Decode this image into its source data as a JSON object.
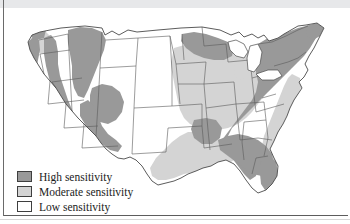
{
  "figure": {
    "type": "choropleth-map",
    "region": "United States",
    "variable": "sensitivity"
  },
  "colors": {
    "high": "#999999",
    "moderate": "#d4d4d4",
    "low": "#ffffff",
    "outline": "#5a5a5a",
    "border_dark": "#3f3f3f",
    "page_band": "#e7e8ea",
    "text": "#1c1c1c"
  },
  "legend": {
    "items": [
      {
        "label": "High sensitivity",
        "swatch": "#999999",
        "key": "high"
      },
      {
        "label": "Moderate sensitivity",
        "swatch": "#d4d4d4",
        "key": "moderate"
      },
      {
        "label": "Low sensitivity",
        "swatch": "#ffffff",
        "key": "low"
      }
    ]
  },
  "map_data": {
    "classification": [
      "High sensitivity",
      "Moderate sensitivity",
      "Low sensitivity"
    ],
    "regions_high": [
      "Pacific Coast Ranges",
      "Sierra Nevada",
      "Cascade Range",
      "Northern Rocky Mountains",
      "Idaho",
      "Central Rocky Mountains",
      "Colorado Plateau",
      "Northern Minnesota",
      "Northern Wisconsin",
      "Upper Michigan",
      "Ozark Plateau / Arkansas",
      "Appalachian Mountains",
      "New England",
      "New York",
      "Pennsylvania",
      "Virginia",
      "West Virginia",
      "North Carolina",
      "South Carolina",
      "Georgia",
      "Alabama",
      "Mississippi",
      "Florida Peninsula",
      "Maine"
    ],
    "regions_moderate": [
      "Iowa",
      "Illinois",
      "Indiana",
      "Ohio",
      "Missouri",
      "Kentucky",
      "Tennessee",
      "Southern Michigan",
      "Southern Wisconsin",
      "Eastern Minnesota",
      "Louisiana",
      "East Texas",
      "Gulf Coastal Plain",
      "Atlantic Coastal Plain",
      "Southern New Jersey",
      "Eastern Washington"
    ],
    "regions_low": [
      "Great Plains",
      "North Dakota",
      "South Dakota",
      "Nebraska",
      "Kansas",
      "Oklahoma",
      "Central Texas",
      "Great Basin",
      "Nevada",
      "Central Valley California",
      "Columbia Basin",
      "Wyoming Basin",
      "Montana Plains"
    ]
  }
}
